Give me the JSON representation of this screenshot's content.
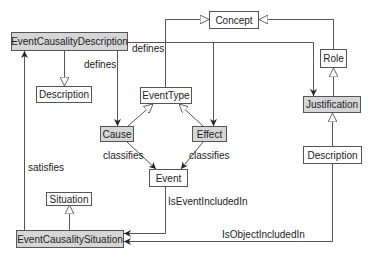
{
  "colors": {
    "line": "#555555",
    "shaded_fill": "#d6d6d6",
    "plain_fill": "#ffffff",
    "text": "#222222"
  },
  "nodes": {
    "concept": {
      "label": "Concept",
      "shaded": false
    },
    "event_causality_description": {
      "label": "EventCausalityDescription",
      "shaded": true
    },
    "description_left": {
      "label": "Description",
      "shaded": false
    },
    "event_type": {
      "label": "EventType",
      "shaded": false
    },
    "role": {
      "label": "Role",
      "shaded": false
    },
    "justification": {
      "label": "Justification",
      "shaded": true
    },
    "cause": {
      "label": "Cause",
      "shaded": true
    },
    "effect": {
      "label": "Effect",
      "shaded": true
    },
    "event": {
      "label": "Event",
      "shaded": false
    },
    "description_right": {
      "label": "Description",
      "shaded": false
    },
    "situation": {
      "label": "Situation",
      "shaded": false
    },
    "event_causality_situation": {
      "label": "EventCausalitySituation",
      "shaded": true
    }
  },
  "edges": {
    "defines_top": "defines",
    "defines_left": "defines",
    "classifies_cause": "classifies",
    "classifies_effect": "classifies",
    "satisfies": "satisfies",
    "is_event_included_in": "IsEventIncludedIn",
    "is_object_included_in": "IsObjectIncludedIn"
  }
}
